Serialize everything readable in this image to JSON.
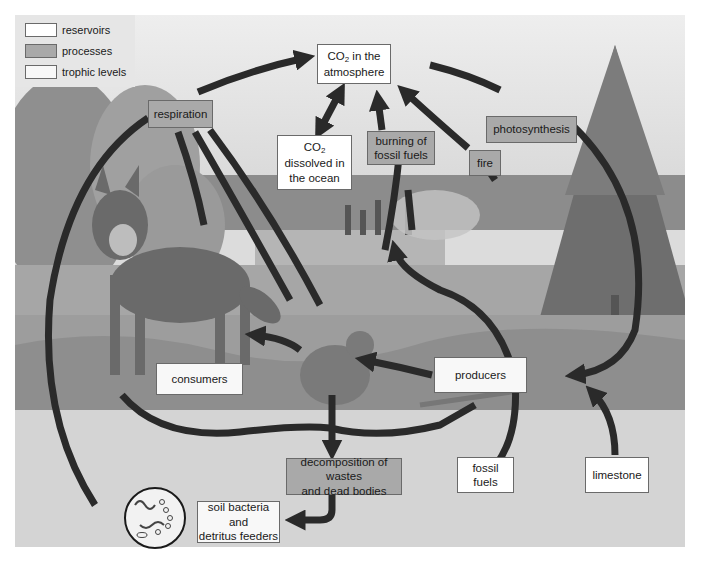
{
  "legend": {
    "items": [
      {
        "label": "reservoirs",
        "color": "#ffffff"
      },
      {
        "label": "processes",
        "color": "#a9a9a9"
      },
      {
        "label": "trophic levels",
        "color": "#f8f8f8"
      }
    ]
  },
  "reservoirs": {
    "atmosphere": {
      "line1_prefix": "CO",
      "line1_sub": "2",
      "line1_suffix": " in the",
      "line2": "atmosphere"
    },
    "ocean": {
      "line1_prefix": "CO",
      "line1_sub": "2",
      "line2": "dissolved in",
      "line3": "the ocean"
    },
    "fossil_fuels": {
      "line1": "fossil",
      "line2": "fuels"
    },
    "limestone": {
      "label": "limestone"
    }
  },
  "processes": {
    "respiration": {
      "label": "respiration"
    },
    "burning": {
      "line1": "burning of",
      "line2": "fossil fuels"
    },
    "fire": {
      "label": "fire"
    },
    "photosynthesis": {
      "label": "photosynthesis"
    },
    "decomposition": {
      "line1": "decomposition of wastes",
      "line2": "and dead bodies"
    }
  },
  "trophic_levels": {
    "consumers": {
      "label": "consumers"
    },
    "producers": {
      "label": "producers"
    },
    "soil_bacteria": {
      "line1": "soil bacteria",
      "line2": "and",
      "line3": "detritus feeders"
    }
  },
  "colors": {
    "arrow": "#2a2a2a",
    "process_fill": "#a9a9a9",
    "reservoir_fill": "#ffffff",
    "sky": "#e4e4e4",
    "ocean": "#8a8a8a",
    "grass": "#9a9a9a",
    "soil": "#d6d6d6"
  }
}
